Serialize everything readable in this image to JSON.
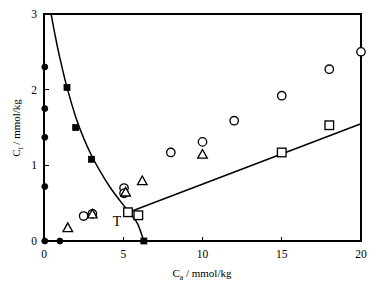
{
  "chart_data": {
    "type": "scatter",
    "title": "",
    "xlabel": "C_a / mmol/kg",
    "xlabel_base": "C",
    "xlabel_sub": "a",
    "xlabel_unit": " / mmol/kg",
    "ylabel": "C_t / mmol/kg",
    "ylabel_base": "C",
    "ylabel_sub": "t",
    "ylabel_unit": " / mmol/kg",
    "xlim": [
      0,
      20
    ],
    "ylim": [
      0,
      3
    ],
    "xticks": [
      0,
      5,
      10,
      15,
      20
    ],
    "yticks": [
      0,
      1,
      2,
      3
    ],
    "xtick_labels": [
      "0",
      "5",
      "10",
      "15",
      "20"
    ],
    "ytick_labels": [
      "0",
      "1",
      "2",
      "3"
    ],
    "grid": false,
    "legend_position": "none",
    "frame": "box",
    "series": [
      {
        "name": "filled-circle",
        "marker": "filled-circle",
        "points": [
          {
            "x": 0.05,
            "y": 2.3
          },
          {
            "x": 0.05,
            "y": 1.75
          },
          {
            "x": 0.05,
            "y": 1.37
          },
          {
            "x": 0.05,
            "y": 0.72
          },
          {
            "x": 0.05,
            "y": 0.0
          },
          {
            "x": 1.0,
            "y": 0.0
          }
        ]
      },
      {
        "name": "filled-square",
        "marker": "filled-square",
        "points": [
          {
            "x": 1.45,
            "y": 2.03
          },
          {
            "x": 2.0,
            "y": 1.5
          },
          {
            "x": 3.0,
            "y": 1.08
          },
          {
            "x": 6.3,
            "y": 0.0
          }
        ]
      },
      {
        "name": "open-circle",
        "marker": "open-circle",
        "points": [
          {
            "x": 2.5,
            "y": 0.33
          },
          {
            "x": 3.05,
            "y": 0.36
          },
          {
            "x": 5.05,
            "y": 0.7
          },
          {
            "x": 5.05,
            "y": 0.63
          },
          {
            "x": 8.0,
            "y": 1.17
          },
          {
            "x": 10.0,
            "y": 1.31
          },
          {
            "x": 12.0,
            "y": 1.59
          },
          {
            "x": 15.0,
            "y": 1.92
          },
          {
            "x": 18.0,
            "y": 2.27
          },
          {
            "x": 20.0,
            "y": 2.5
          }
        ]
      },
      {
        "name": "open-triangle",
        "marker": "open-triangle",
        "points": [
          {
            "x": 1.5,
            "y": 0.17
          },
          {
            "x": 3.05,
            "y": 0.35
          },
          {
            "x": 5.15,
            "y": 0.64
          },
          {
            "x": 6.2,
            "y": 0.79
          },
          {
            "x": 10.0,
            "y": 1.14
          }
        ]
      },
      {
        "name": "open-square",
        "marker": "open-square",
        "points": [
          {
            "x": 5.3,
            "y": 0.38
          },
          {
            "x": 5.95,
            "y": 0.34
          },
          {
            "x": 15.0,
            "y": 1.17
          },
          {
            "x": 18.0,
            "y": 1.53
          }
        ]
      }
    ],
    "curves": [
      {
        "name": "descending-curve",
        "points": [
          {
            "x": 0.45,
            "y": 3.0
          },
          {
            "x": 0.7,
            "y": 2.72
          },
          {
            "x": 1.0,
            "y": 2.42
          },
          {
            "x": 1.45,
            "y": 2.03
          },
          {
            "x": 2.0,
            "y": 1.64
          },
          {
            "x": 2.5,
            "y": 1.36
          },
          {
            "x": 3.0,
            "y": 1.13
          },
          {
            "x": 3.6,
            "y": 0.9
          },
          {
            "x": 4.2,
            "y": 0.7
          },
          {
            "x": 4.8,
            "y": 0.53
          },
          {
            "x": 5.4,
            "y": 0.37
          },
          {
            "x": 5.9,
            "y": 0.23
          },
          {
            "x": 6.3,
            "y": 0.0
          }
        ]
      },
      {
        "name": "ascending-line",
        "points": [
          {
            "x": 5.1,
            "y": 0.36
          },
          {
            "x": 20.0,
            "y": 1.55
          }
        ]
      }
    ],
    "annotations": [
      {
        "name": "T",
        "text": "T",
        "x": 4.6,
        "y": 0.2
      }
    ]
  }
}
